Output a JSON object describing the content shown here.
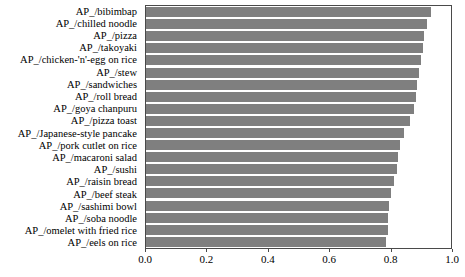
{
  "chart_data": {
    "type": "bar",
    "orientation": "horizontal",
    "title": "",
    "subtitle": "",
    "xlabel": "",
    "ylabel": "",
    "xlim": [
      0.0,
      1.0
    ],
    "xticks": [
      "0.0",
      "0.2",
      "0.4",
      "0.6",
      "0.8",
      "1.0"
    ],
    "xtick_values": [
      0.0,
      0.2,
      0.4,
      0.6,
      0.8,
      1.0
    ],
    "grid": false,
    "legend": null,
    "bar_color": "#7f7f7f",
    "axis_color": "#4a4a4a",
    "categories": [
      "AP_/bibimbap",
      "AP_/chilled noodle",
      "AP_/pizza",
      "AP_/takoyaki",
      "AP_/chicken-'n'-egg on rice",
      "AP_/stew",
      "AP_/sandwiches",
      "AP_/roll bread",
      "AP_/goya chanpuru",
      "AP_/pizza toast",
      "AP_/Japanese-style pancake",
      "AP_/pork cutlet on rice",
      "AP_/macaroni salad",
      "AP_/sushi",
      "AP_/raisin bread",
      "AP_/beef steak",
      "AP_/sashimi bowl",
      "AP_/soba noodle",
      "AP_/omelet with fried rice",
      "AP_/eels on rice"
    ],
    "values": [
      0.935,
      0.921,
      0.912,
      0.908,
      0.901,
      0.896,
      0.889,
      0.885,
      0.879,
      0.866,
      0.847,
      0.833,
      0.827,
      0.824,
      0.813,
      0.803,
      0.798,
      0.795,
      0.792,
      0.788
    ]
  }
}
